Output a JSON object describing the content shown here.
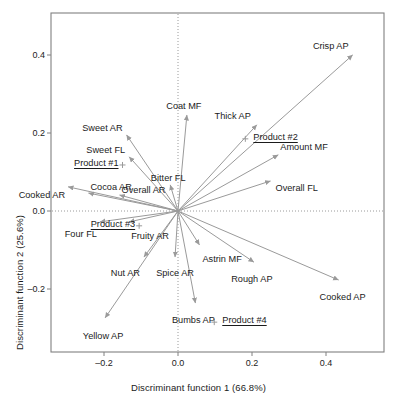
{
  "chart_data": {
    "type": "scatter",
    "subtype": "biplot-vector-loading",
    "title": "",
    "xlabel": "Discriminant function 1 (66.8%)",
    "ylabel": "Discriminant function 2 (25.6%)",
    "xlim": [
      -0.3,
      0.54
    ],
    "ylim": [
      -0.32,
      0.47
    ],
    "xticks": [
      -0.2,
      0.0,
      0.2,
      0.4
    ],
    "xticklabels": [
      "–0.2",
      "0.0",
      "0.2",
      "0.4"
    ],
    "yticks": [
      0.4,
      0.2,
      0.0,
      -0.2
    ],
    "yticklabels": [
      "0.4",
      "0.2",
      "0.0",
      "–0.2"
    ],
    "grid": false,
    "zero_lines": "dotted",
    "legend": "none",
    "variance_explained": {
      "function_1": "66.8%",
      "function_2": "25.6%"
    },
    "origin": [
      0.0,
      0.0
    ],
    "vectors": [
      {
        "label": "Crisp AP",
        "x": 0.472,
        "y": 0.4,
        "label_dx": -4,
        "label_dy": -13,
        "anchor": "end"
      },
      {
        "label": "Coat MF",
        "x": 0.024,
        "y": 0.246,
        "label_dx": -3,
        "label_dy": -13,
        "anchor": "middle"
      },
      {
        "label": "Thick AP",
        "x": 0.213,
        "y": 0.221,
        "label_dx": -6,
        "label_dy": -13,
        "anchor": "end"
      },
      {
        "label": "Amount MF",
        "x": 0.271,
        "y": 0.144,
        "label_dx": 2,
        "label_dy": -12,
        "anchor": "start"
      },
      {
        "label": "Sweet AR",
        "x": -0.139,
        "y": 0.195,
        "label_dx": -4,
        "label_dy": -11,
        "anchor": "end"
      },
      {
        "label": "Sweet FL",
        "x": -0.132,
        "y": 0.139,
        "label_dx": -4,
        "label_dy": -11,
        "anchor": "end"
      },
      {
        "label": "Bitter FL",
        "x": -0.021,
        "y": 0.067,
        "label_dx": -2,
        "label_dy": -11,
        "anchor": "middle"
      },
      {
        "label": "Overall FL",
        "x": 0.25,
        "y": 0.077,
        "label_dx": 5,
        "label_dy": 3.5,
        "anchor": "start"
      },
      {
        "label": "Cocoa AR",
        "x": -0.242,
        "y": 0.046,
        "label_dx": 2,
        "label_dy": -10,
        "anchor": "start"
      },
      {
        "label": "Cooked AR",
        "x": -0.297,
        "y": 0.062,
        "label_dx": -3,
        "label_dy": 4,
        "anchor": "end"
      },
      {
        "label": "Overall AR",
        "x": -0.158,
        "y": 0.041,
        "label_dx": 2,
        "label_dy": -9,
        "anchor": "start"
      },
      {
        "label": "Four FL",
        "x": -0.211,
        "y": -0.028,
        "label_dx": -3,
        "label_dy": 8,
        "anchor": "end"
      },
      {
        "label": "Fruity AR",
        "x": -0.132,
        "y": -0.028,
        "label_dx": 2,
        "label_dy": 10,
        "anchor": "start"
      },
      {
        "label": "Nut AR",
        "x": -0.092,
        "y": -0.118,
        "label_dx": -4,
        "label_dy": 12,
        "anchor": "end"
      },
      {
        "label": "Spice AR",
        "x": -0.008,
        "y": -0.118,
        "label_dx": 0,
        "label_dy": 12,
        "anchor": "middle"
      },
      {
        "label": "Astrin MF",
        "x": 0.058,
        "y": -0.087,
        "label_dx": 3,
        "label_dy": 10,
        "anchor": "start"
      },
      {
        "label": "Rough AP",
        "x": 0.205,
        "y": -0.131,
        "label_dx": -2,
        "label_dy": 13,
        "anchor": "middle"
      },
      {
        "label": "Cooked AP",
        "x": 0.434,
        "y": -0.177,
        "label_dx": 4,
        "label_dy": 13,
        "anchor": "middle"
      },
      {
        "label": "Bumbs AP",
        "x": 0.047,
        "y": -0.236,
        "label_dx": -2,
        "label_dy": 13,
        "anchor": "middle"
      },
      {
        "label": "Yellow AP",
        "x": -0.197,
        "y": -0.274,
        "label_dx": -2,
        "label_dy": 14,
        "anchor": "middle"
      }
    ],
    "products": [
      {
        "name": "Product #1",
        "marker": "+",
        "x": -0.15,
        "y": 0.118,
        "label_side": "left"
      },
      {
        "name": "Product #2",
        "marker": "+",
        "x": 0.182,
        "y": 0.185,
        "label_side": "right"
      },
      {
        "name": "Product #3",
        "marker": "+",
        "x": -0.105,
        "y": -0.038,
        "label_side": "left"
      },
      {
        "name": "Product #4",
        "marker": "+",
        "x": 0.098,
        "y": -0.285,
        "label_side": "right"
      }
    ],
    "colors": {
      "arrow": "#9a9a9a",
      "text": "#1b1b1b",
      "frame": "#808080",
      "zero_line": "#9a9a9a",
      "background": "#ffffff"
    }
  }
}
